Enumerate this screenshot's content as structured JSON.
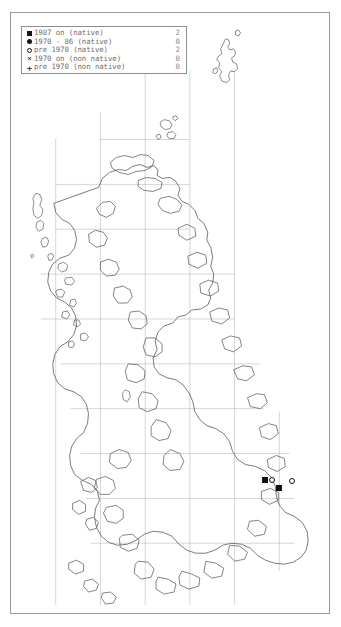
{
  "map": {
    "title": "Species distribution map of the British Isles",
    "region": "British Isles",
    "background_color": "#ffffff",
    "frame_color": "#9a9a9a",
    "coastline_color": "#5a5a5a",
    "grid_color": "#b9b9b9",
    "grid_spacing_px": 45
  },
  "legend": {
    "border_color": "#8d8d8d",
    "text_color": "#6f6f6f",
    "count_color": "#8a8a8a",
    "rows": [
      {
        "icon": "filled-square-icon",
        "label": "1987 on (native)",
        "count": "2"
      },
      {
        "icon": "filled-circle-icon",
        "label": "1970 - 86 (native)",
        "count": "0"
      },
      {
        "icon": "open-circle-icon",
        "label": "pre 1970 (native)",
        "count": "2"
      },
      {
        "icon": "cross-x-icon",
        "label": "1970 on (non native)",
        "count": "0"
      },
      {
        "icon": "plus-icon",
        "label": "pre 1970 (non native)",
        "count": "0"
      }
    ]
  },
  "records": {
    "total": 4,
    "points": [
      {
        "type": "filled-square",
        "x": 251,
        "y": 464,
        "class": "1987 on (native)"
      },
      {
        "type": "open-circle",
        "x": 258,
        "y": 464,
        "class": "pre 1970 (native)"
      },
      {
        "type": "filled-square",
        "x": 265,
        "y": 472,
        "class": "1987 on (native)"
      },
      {
        "type": "open-circle",
        "x": 278,
        "y": 465,
        "class": "pre 1970 (native)"
      }
    ]
  }
}
